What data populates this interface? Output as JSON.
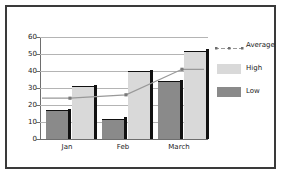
{
  "chart_data": {
    "type": "bar",
    "title": "",
    "xlabel": "",
    "ylabel": "",
    "categories": [
      "Jan",
      "Feb",
      "March"
    ],
    "ylim": [
      0,
      60
    ],
    "yticks": [
      0,
      10,
      20,
      30,
      40,
      50,
      60
    ],
    "grid": true,
    "legend_position": "right",
    "series": [
      {
        "name": "Average",
        "type": "line",
        "values": [
          24,
          26,
          41
        ],
        "color": "#999999"
      },
      {
        "name": "High",
        "type": "bar",
        "values": [
          31,
          40,
          52
        ],
        "color": "#d9d9d9"
      },
      {
        "name": "Low",
        "type": "bar",
        "values": [
          17,
          12,
          34
        ],
        "color": "#8a8a8a"
      }
    ]
  },
  "legend": {
    "entries": [
      {
        "label": "Average",
        "marker": "line-with-markers"
      },
      {
        "label": "High",
        "marker": "swatch"
      },
      {
        "label": "Low",
        "marker": "swatch"
      }
    ]
  },
  "axis": {
    "y_tick_labels": [
      "60",
      "50",
      "40",
      "30",
      "20",
      "10",
      "0"
    ],
    "x_tick_labels": [
      "Jan",
      "Feb",
      "March"
    ]
  },
  "colors": {
    "high_bar": "#d9d9d9",
    "low_bar": "#8a8a8a",
    "average_line": "#999999",
    "gridline": "#b4b4b4",
    "axis": "#6e6e6e",
    "border": "#3a3a3a",
    "background": "#ffffff",
    "text": "#1a1a1a"
  }
}
